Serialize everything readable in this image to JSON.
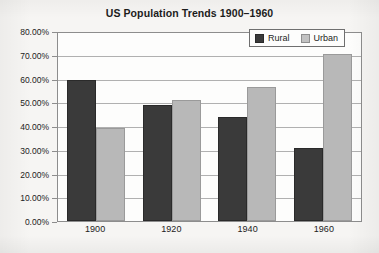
{
  "chart_data": {
    "type": "bar",
    "title": "US Population Trends 1900–1960",
    "xlabel": "",
    "ylabel": "",
    "categories": [
      "1900",
      "1920",
      "1940",
      "1960"
    ],
    "series": [
      {
        "name": "Rural",
        "color": "#3a3a3a",
        "values": [
          60.0,
          49.4,
          44.2,
          31.0
        ]
      },
      {
        "name": "Urban",
        "color": "#b8b8b8",
        "values": [
          39.7,
          51.7,
          57.0,
          71.0
        ]
      }
    ],
    "ylim": [
      0,
      80
    ],
    "ytick_values": [
      0,
      10,
      20,
      30,
      40,
      50,
      60,
      70,
      80
    ],
    "ytick_labels": [
      "0.00%",
      "10.00%",
      "20.00%",
      "30.00%",
      "40.00%",
      "50.00%",
      "60.00%",
      "70.00%",
      "80.00%"
    ],
    "grid": true,
    "legend_position": "top-right-inside",
    "legend_entries": [
      "Rural",
      "Urban"
    ]
  },
  "colors": {
    "background": "#f6f5f3",
    "plot_background": "#fdfdfc",
    "axis": "#8d8d8d",
    "gridline": "#b0b0b0",
    "rural": "#3a3a3a",
    "urban": "#b8b8b8",
    "text": "#1c1c1c"
  }
}
